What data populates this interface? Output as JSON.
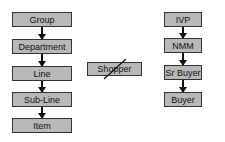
{
  "diagram": {
    "left_column": [
      "Group",
      "Department",
      "Line",
      "Sub-Line",
      "Item"
    ],
    "middle": {
      "label": "Shopper",
      "crossed_out": true
    },
    "right_column": [
      "IVP",
      "NMM",
      "Sr Buyer",
      "Buyer"
    ],
    "colors": {
      "box_fill": "#b8b8b8",
      "border": "#333333",
      "arrow": "#111111"
    }
  }
}
